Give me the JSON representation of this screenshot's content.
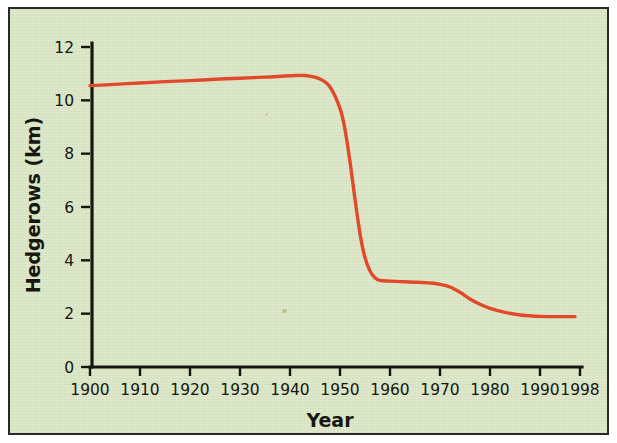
{
  "figure": {
    "background_color": "#dee9cb",
    "border_color": "#2a2a28",
    "page_color": "#ffffff"
  },
  "chart_data": {
    "type": "line",
    "title": "",
    "xlabel": "Year",
    "ylabel": "Hedgerows (km)",
    "xlim": [
      1900,
      1998
    ],
    "ylim": [
      0,
      12
    ],
    "grid": false,
    "legend": "none",
    "line_color": "#e2492a",
    "xticks": [
      1900,
      1910,
      1920,
      1930,
      1940,
      1950,
      1960,
      1970,
      1980,
      1990,
      1998
    ],
    "xtick_labels": [
      "1900",
      "1910",
      "1920",
      "1930",
      "1940",
      "1950",
      "1960",
      "1970",
      "1980",
      "1990",
      "1998"
    ],
    "yticks": [
      0,
      2,
      4,
      6,
      8,
      10,
      12
    ],
    "ytick_labels": [
      "0",
      "2",
      "4",
      "6",
      "8",
      "10",
      "12"
    ],
    "series": [
      {
        "name": "Hedgerows",
        "x": [
          1900,
          1905,
          1910,
          1915,
          1920,
          1925,
          1930,
          1935,
          1940,
          1943,
          1946,
          1948,
          1950,
          1951,
          1952,
          1953,
          1954,
          1955,
          1956,
          1957,
          1958,
          1960,
          1962,
          1965,
          1968,
          1970,
          1972,
          1974,
          1976,
          1978,
          1980,
          1983,
          1986,
          1988,
          1990,
          1994,
          1997
        ],
        "y": [
          10.55,
          10.6,
          10.65,
          10.7,
          10.74,
          10.79,
          10.83,
          10.87,
          10.92,
          10.93,
          10.8,
          10.5,
          9.7,
          8.9,
          7.7,
          6.3,
          5.0,
          4.1,
          3.6,
          3.35,
          3.25,
          3.22,
          3.2,
          3.18,
          3.15,
          3.1,
          3.0,
          2.8,
          2.55,
          2.35,
          2.2,
          2.05,
          1.95,
          1.92,
          1.9,
          1.89,
          1.89
        ]
      }
    ]
  },
  "plot_geometry": {
    "left_px": 88,
    "right_px": 578,
    "top_px": 40,
    "baseline_px": 365
  },
  "icons": {
    "chart_line": "line-chart-icon"
  }
}
